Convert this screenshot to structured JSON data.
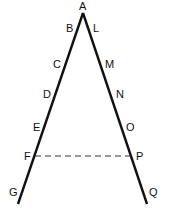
{
  "diagram": {
    "type": "two lines from a common apex with a dashed transversal",
    "apex": {
      "label": "A",
      "x": 83,
      "y": 13
    },
    "left_line": {
      "end": {
        "x": 18,
        "y": 204
      },
      "labels": [
        {
          "text": "B",
          "x": 66,
          "y": 32
        },
        {
          "text": "C",
          "x": 53,
          "y": 68
        },
        {
          "text": "D",
          "x": 43,
          "y": 98
        },
        {
          "text": "E",
          "x": 33,
          "y": 131
        },
        {
          "text": "F",
          "x": 24,
          "y": 160
        },
        {
          "text": "G",
          "x": 9,
          "y": 196
        }
      ]
    },
    "right_line": {
      "end": {
        "x": 147,
        "y": 204
      },
      "labels": [
        {
          "text": "L",
          "x": 93,
          "y": 32
        },
        {
          "text": "M",
          "x": 105,
          "y": 68
        },
        {
          "text": "N",
          "x": 116,
          "y": 98
        },
        {
          "text": "O",
          "x": 126,
          "y": 131
        },
        {
          "text": "P",
          "x": 136,
          "y": 160
        },
        {
          "text": "Q",
          "x": 149,
          "y": 196
        }
      ]
    },
    "dashed_segment": {
      "from": "F",
      "to": "P",
      "x1": 35,
      "y1": 156,
      "x2": 132,
      "y2": 156
    },
    "colors": {
      "line": "#111111",
      "background": "#ffffff"
    }
  }
}
